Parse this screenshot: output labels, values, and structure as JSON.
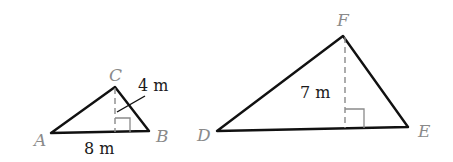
{
  "diagram": {
    "type": "similar-triangles",
    "triangles": [
      {
        "name": "ABC",
        "vertices": {
          "A": {
            "label": "A",
            "x": 51,
            "y": 133
          },
          "B": {
            "label": "B",
            "x": 149,
            "y": 131
          },
          "C": {
            "label": "C",
            "x": 115,
            "y": 87
          }
        },
        "base_label": "8 m",
        "height_label": "4 m"
      },
      {
        "name": "DEF",
        "vertices": {
          "D": {
            "label": "D",
            "x": 217,
            "y": 131
          },
          "E": {
            "label": "E",
            "x": 408,
            "y": 127
          },
          "F": {
            "label": "F",
            "x": 343,
            "y": 36
          }
        },
        "height_label": "7 m"
      }
    ]
  },
  "colors": {
    "edge": "#111111",
    "vertex_label": "#8a8a8a",
    "height_line": "#8a8a8a",
    "measure_text": "#1a1a1a"
  }
}
